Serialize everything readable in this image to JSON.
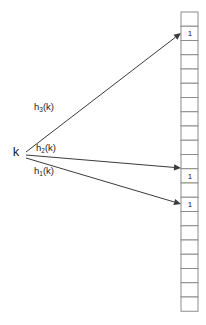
{
  "diagram": {
    "type": "bloom-filter-hash-mapping",
    "canvas": {
      "width": 206,
      "height": 325,
      "background": "#ffffff"
    },
    "key": {
      "label": "k",
      "x": 16,
      "y": 156
    },
    "arrows": [
      {
        "id": "h3",
        "label_base": "h",
        "label_sub": "3",
        "label_tail": "(k)",
        "label_full": "h3(k)",
        "label_x": 44,
        "label_y": 110,
        "from_x": 26,
        "from_y": 152,
        "to_x": 181,
        "to_y": 33,
        "target_cell_index": 1
      },
      {
        "id": "h2",
        "label_base": "h",
        "label_sub": "2",
        "label_tail": "(k)",
        "label_full": "h2(k)",
        "label_x": 46,
        "label_y": 151,
        "from_x": 26,
        "from_y": 155,
        "to_x": 181,
        "to_y": 168,
        "target_cell_index": 11
      },
      {
        "id": "h1",
        "label_base": "h",
        "label_sub": "1",
        "label_tail": "(k)",
        "label_full": "h1(k)",
        "label_x": 44,
        "label_y": 174,
        "from_x": 26,
        "from_y": 158,
        "to_x": 181,
        "to_y": 204,
        "target_cell_index": 13
      }
    ],
    "bit_array": {
      "name": "bit-array",
      "x": 181,
      "y": 12,
      "cell_width": 17,
      "cell_height": 14.25,
      "cell_count": 21,
      "set_value": "1",
      "border_color": "#8c8c8c",
      "fill_color": "#ffffff",
      "cells": [
        {
          "index": 0,
          "value": ""
        },
        {
          "index": 1,
          "value": "1"
        },
        {
          "index": 2,
          "value": ""
        },
        {
          "index": 3,
          "value": ""
        },
        {
          "index": 4,
          "value": ""
        },
        {
          "index": 5,
          "value": ""
        },
        {
          "index": 6,
          "value": ""
        },
        {
          "index": 7,
          "value": ""
        },
        {
          "index": 8,
          "value": ""
        },
        {
          "index": 9,
          "value": ""
        },
        {
          "index": 10,
          "value": ""
        },
        {
          "index": 11,
          "value": "1"
        },
        {
          "index": 12,
          "value": ""
        },
        {
          "index": 13,
          "value": "1"
        },
        {
          "index": 14,
          "value": ""
        },
        {
          "index": 15,
          "value": ""
        },
        {
          "index": 16,
          "value": ""
        },
        {
          "index": 17,
          "value": ""
        },
        {
          "index": 18,
          "value": ""
        },
        {
          "index": 19,
          "value": ""
        },
        {
          "index": 20,
          "value": ""
        }
      ]
    }
  }
}
